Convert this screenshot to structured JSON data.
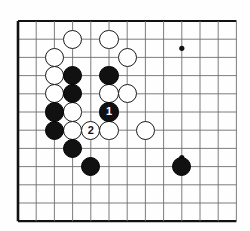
{
  "diagram": {
    "kind": "go-board-problem-diagram",
    "board": {
      "cols": 12,
      "rows": 11,
      "origin_x": 18,
      "origin_y": 21,
      "spacing": 18.2,
      "line_color": "#6e6e6e",
      "edge_color": "#111111",
      "background": "#fefefe",
      "stone_radius": 9.6
    },
    "star_points": [
      {
        "col": 9,
        "row": 1.5
      },
      {
        "col": 9,
        "row": 7.5
      }
    ],
    "stones": [
      {
        "color": "white",
        "col": 3,
        "row": 1,
        "label": ""
      },
      {
        "color": "white",
        "col": 5,
        "row": 1,
        "label": ""
      },
      {
        "color": "white",
        "col": 2,
        "row": 2,
        "label": ""
      },
      {
        "color": "white",
        "col": 6,
        "row": 2,
        "label": ""
      },
      {
        "color": "white",
        "col": 2,
        "row": 3,
        "label": ""
      },
      {
        "color": "white",
        "col": 2,
        "row": 4,
        "label": ""
      },
      {
        "color": "white",
        "col": 5,
        "row": 4,
        "label": ""
      },
      {
        "color": "white",
        "col": 6,
        "row": 4,
        "label": ""
      },
      {
        "color": "white",
        "col": 3,
        "row": 5,
        "label": ""
      },
      {
        "color": "white",
        "col": 3,
        "row": 6,
        "label": ""
      },
      {
        "color": "white",
        "col": 4,
        "row": 6,
        "label": "2"
      },
      {
        "color": "white",
        "col": 5,
        "row": 6,
        "label": ""
      },
      {
        "color": "white",
        "col": 7,
        "row": 6,
        "label": ""
      },
      {
        "color": "black",
        "col": 3,
        "row": 3,
        "label": ""
      },
      {
        "color": "black",
        "col": 5,
        "row": 3,
        "label": ""
      },
      {
        "color": "black",
        "col": 3,
        "row": 4,
        "label": ""
      },
      {
        "color": "black",
        "col": 2,
        "row": 5,
        "label": ""
      },
      {
        "color": "black",
        "col": 5,
        "row": 5,
        "label": "1"
      },
      {
        "color": "black",
        "col": 2,
        "row": 6,
        "label": ""
      },
      {
        "color": "black",
        "col": 3,
        "row": 7,
        "label": ""
      },
      {
        "color": "black",
        "col": 4,
        "row": 8,
        "label": ""
      },
      {
        "color": "black",
        "col": 9,
        "row": 8,
        "label": ""
      }
    ],
    "move_labels": [
      {
        "number": "1",
        "color": "black"
      },
      {
        "number": "2",
        "color": "white"
      }
    ]
  }
}
